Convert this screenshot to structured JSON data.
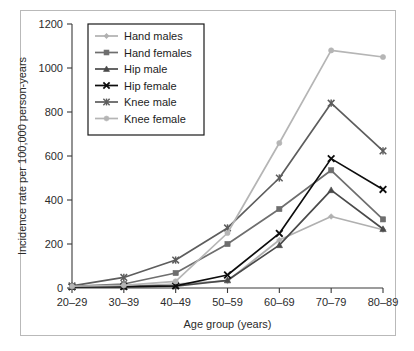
{
  "chart_data": {
    "type": "line",
    "title": "",
    "xlabel": "Age group (years)",
    "ylabel": "Incidence rate per 100,000 person-years",
    "categories": [
      "20–29",
      "30–39",
      "40–49",
      "50–59",
      "60–69",
      "70–79",
      "80–89"
    ],
    "x": [
      "20–29",
      "30–39",
      "40–49",
      "50–59",
      "60–69",
      "70–79",
      "80–89"
    ],
    "ylim": [
      0,
      1200
    ],
    "yticks": [
      0,
      200,
      400,
      600,
      800,
      1000,
      1200
    ],
    "ytick_labels": [
      "0",
      "200",
      "400",
      "600",
      "800",
      "1000",
      "1200"
    ],
    "grid": false,
    "legend_position": "top-left",
    "series": [
      {
        "name": "Hand males",
        "color": "#b0b0b0",
        "marker": "diamond",
        "values": [
          5,
          8,
          18,
          32,
          218,
          325,
          265
        ]
      },
      {
        "name": "Hand females",
        "color": "#6e6e6e",
        "marker": "square",
        "values": [
          8,
          18,
          68,
          200,
          359,
          535,
          312
        ]
      },
      {
        "name": "Hip male",
        "color": "#4a4a4a",
        "marker": "triangle",
        "values": [
          5,
          5,
          8,
          35,
          195,
          445,
          268
        ]
      },
      {
        "name": "Hip female",
        "color": "#0d0d0d",
        "marker": "x",
        "values": [
          5,
          6,
          10,
          59,
          248,
          588,
          448
        ]
      },
      {
        "name": "Knee male",
        "color": "#5d5d5d",
        "marker": "asterisk",
        "values": [
          10,
          48,
          127,
          273,
          500,
          840,
          623
        ]
      },
      {
        "name": "Knee female",
        "color": "#b5b5b5",
        "marker": "circle",
        "values": [
          8,
          12,
          30,
          250,
          659,
          1080,
          1050
        ]
      }
    ]
  },
  "axes": {
    "y_title": "Incidence rate per 100,000 person-years",
    "x_title": "Age group (years)"
  },
  "legend": {
    "entries": [
      {
        "label": "Hand males"
      },
      {
        "label": "Hand females"
      },
      {
        "label": "Hip male"
      },
      {
        "label": "Hip female"
      },
      {
        "label": "Knee male"
      },
      {
        "label": "Knee female"
      }
    ]
  }
}
